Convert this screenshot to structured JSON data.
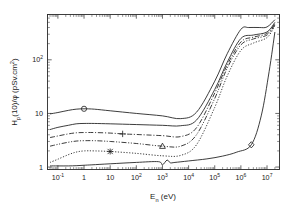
{
  "figure": {
    "background": "#ffffff",
    "ink_color": "#1a1a1a"
  },
  "chart_data": {
    "type": "line",
    "title": "",
    "xlabel": "E_n (eV)",
    "ylabel": "H_p(10)/φ (pSv.cm²)",
    "xscale": "log",
    "yscale": "log",
    "xlim": [
      0.04,
      30000000
    ],
    "ylim": [
      0.9,
      700
    ],
    "grid": false,
    "legend_position": "none",
    "xtick_labels": [
      "10⁻¹",
      "1",
      "10",
      "10²",
      "10³",
      "10⁴",
      "10⁵",
      "10⁶",
      "10⁷"
    ],
    "xtick_values": [
      0.1,
      1,
      10,
      100,
      1000,
      10000,
      100000,
      1000000,
      10000000
    ],
    "ytick_labels": [
      "1",
      "10",
      "10²"
    ],
    "ytick_values": [
      1,
      10,
      100
    ],
    "annotations": [
      {
        "marker": "circle",
        "x": 1.0,
        "y": 12.2,
        "series": "AP"
      },
      {
        "marker": "plus",
        "x": 30.0,
        "y": 4.15,
        "series": "PA"
      },
      {
        "marker": "triangle",
        "x": 1000.0,
        "y": 2.45,
        "series": "LLAT"
      },
      {
        "marker": "x",
        "x": 10.0,
        "y": 1.95,
        "series": "ISO"
      },
      {
        "marker": "diamond",
        "x": 2500000.0,
        "y": 2.6,
        "series": "ROT"
      }
    ],
    "series": [
      {
        "name": "AP",
        "linestyle": "solid",
        "marker": "circle",
        "marker_x": 1.0,
        "x": [
          0.05,
          0.1,
          0.25,
          0.5,
          1.0,
          2.5,
          10,
          100,
          1000,
          5000,
          20000,
          100000,
          300000,
          1000000,
          2000000,
          5000000,
          10000000,
          20000000
        ],
        "y": [
          9.8,
          10.4,
          11.4,
          12.0,
          12.2,
          12.0,
          11.2,
          10.0,
          9.0,
          8.0,
          10.5,
          40.0,
          130.0,
          370.0,
          400.0,
          400.0,
          410.0,
          560.0
        ]
      },
      {
        "name": "PA-upper-solid",
        "linestyle": "solid",
        "marker": "none",
        "x": [
          0.05,
          0.1,
          0.25,
          0.5,
          1.0,
          2.5,
          10,
          100,
          1000,
          5000,
          20000,
          100000,
          300000,
          1000000,
          3000000,
          10000000,
          20000000
        ],
        "y": [
          5.0,
          5.5,
          6.0,
          6.4,
          6.5,
          6.5,
          6.4,
          6.2,
          6.0,
          5.9,
          7.5,
          28.0,
          90.0,
          250.0,
          290.0,
          330.0,
          500.0
        ]
      },
      {
        "name": "PA",
        "linestyle": "dashdot",
        "marker": "plus",
        "marker_x": 30.0,
        "x": [
          0.05,
          0.1,
          0.25,
          0.5,
          1.0,
          2.5,
          10,
          30,
          100,
          1000,
          5000,
          20000,
          100000,
          300000,
          1000000,
          3000000,
          10000000,
          20000000
        ],
        "y": [
          3.55,
          3.8,
          4.15,
          4.35,
          4.4,
          4.4,
          4.3,
          4.15,
          4.05,
          3.85,
          3.7,
          5.4,
          24.0,
          80.0,
          215.0,
          265.0,
          310.0,
          470.0
        ]
      },
      {
        "name": "LLAT",
        "linestyle": "dashdotdot",
        "marker": "triangle",
        "marker_x": 1000.0,
        "x": [
          0.05,
          0.1,
          0.25,
          0.5,
          1.0,
          2.5,
          10,
          100,
          1000,
          5000,
          20000,
          100000,
          300000,
          1000000,
          3000000,
          10000000,
          20000000
        ],
        "y": [
          2.45,
          2.65,
          2.9,
          3.05,
          3.1,
          3.1,
          3.0,
          2.75,
          2.45,
          2.45,
          4.0,
          19.0,
          70.0,
          190.0,
          245.0,
          290.0,
          450.0
        ]
      },
      {
        "name": "ISO",
        "linestyle": "dotted",
        "marker": "x",
        "marker_x": 10.0,
        "x": [
          0.05,
          0.1,
          0.25,
          0.5,
          1.0,
          2.5,
          10,
          100,
          1000,
          5000,
          20000,
          100000,
          300000,
          1000000,
          3000000,
          10000000,
          20000000
        ],
        "y": [
          1.22,
          1.4,
          1.7,
          1.9,
          2.0,
          2.0,
          1.95,
          1.8,
          1.62,
          1.65,
          2.6,
          13.0,
          50.0,
          150.0,
          205.0,
          260.0,
          430.0
        ]
      },
      {
        "name": "ROT",
        "linestyle": "solid",
        "marker": "diamond",
        "marker_x": 2500000.0,
        "x": [
          0.05,
          0.1,
          0.25,
          0.5,
          1.0,
          2.0,
          10,
          100,
          700,
          1000,
          1500,
          2000,
          3000,
          10000,
          50000,
          200000,
          700000,
          2500000,
          6000000,
          12000000,
          20000000
        ],
        "y": [
          1.05,
          1.05,
          1.05,
          1.06,
          1.08,
          1.1,
          1.15,
          1.22,
          1.26,
          1.1,
          1.35,
          1.2,
          1.22,
          1.3,
          1.42,
          1.6,
          1.9,
          2.6,
          9.0,
          60.0,
          330.0
        ]
      }
    ]
  }
}
